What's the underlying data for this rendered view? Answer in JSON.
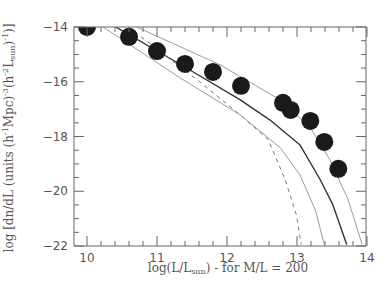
{
  "chart_data": {
    "type": "scatter",
    "title": "",
    "xlabel": "log(L/L_sun) - for M/L = 200",
    "xlabel_parts": {
      "pre": "log(L/L",
      "sub": "sun",
      "post": ") - for M/L = 200"
    },
    "ylabel": "log [dn/dL (units (h^-1 Mpc)^-3 (h^-2 L_sun)^-1)]",
    "ylabel_parts": {
      "a": "log [dn/dL (units (h",
      "b": "-1",
      "c": "Mpc)",
      "d": "-3",
      "e": "(h",
      "f": "-2",
      "g": "L",
      "h": "sun",
      "i": ")",
      "j": "-1",
      "k": ")]"
    },
    "xlim": [
      9.8,
      14
    ],
    "ylim": [
      -22,
      -14
    ],
    "xticks": [
      10,
      11,
      12,
      13,
      14
    ],
    "xtick_labels": [
      "10",
      "11",
      "12",
      "13",
      "14"
    ],
    "yticks": [
      -14,
      -16,
      -18,
      -20,
      -22
    ],
    "ytick_labels": [
      "-14",
      "-16",
      "-18",
      "-20",
      "-22"
    ],
    "grid": false,
    "series": [
      {
        "name": "data points",
        "style": "filled-circle",
        "x": [
          10.0,
          10.6,
          11.0,
          11.4,
          11.8,
          12.2,
          12.8,
          12.91,
          13.19,
          13.39,
          13.59
        ],
        "y": [
          -14.0,
          -14.36,
          -14.88,
          -15.35,
          -15.64,
          -16.15,
          -16.77,
          -17.03,
          -17.43,
          -18.2,
          -19.18
        ]
      },
      {
        "name": "upper model (gray)",
        "style": "solid-gray",
        "x": [
          10.71,
          11.9,
          12.76,
          13.19,
          13.47,
          13.73,
          13.93
        ],
        "y": [
          -14.0,
          -15.38,
          -16.66,
          -17.68,
          -18.85,
          -20.3,
          -21.94
        ]
      },
      {
        "name": "main model (dark)",
        "style": "solid-dark",
        "x": [
          10.41,
          11.47,
          12.19,
          12.61,
          13.04,
          13.33,
          13.51,
          13.71
        ],
        "y": [
          -14.0,
          -15.57,
          -16.66,
          -17.39,
          -18.3,
          -19.57,
          -20.48,
          -21.94
        ]
      },
      {
        "name": "dashed model",
        "style": "dashed",
        "x": [
          10.59,
          11.61,
          12.19,
          12.59,
          12.83,
          12.99,
          13.06
        ],
        "y": [
          -14.0,
          -16.0,
          -17.21,
          -18.12,
          -19.57,
          -20.85,
          -21.94
        ]
      },
      {
        "name": "lower model (gray)",
        "style": "solid-gray",
        "x": [
          10.23,
          11.33,
          12.19,
          12.76,
          13.04,
          13.26,
          13.39
        ],
        "y": [
          -14.0,
          -15.86,
          -17.21,
          -18.41,
          -19.39,
          -20.67,
          -21.94
        ]
      }
    ],
    "colors": {
      "frame": "#555555",
      "dots": "#1a1a1a",
      "dark_line": "#333333",
      "gray_line": "#9a9a9a",
      "dashed_line": "#777777"
    }
  }
}
